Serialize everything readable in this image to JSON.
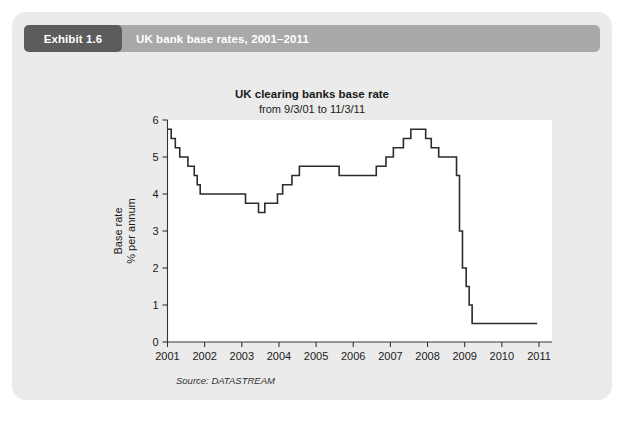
{
  "exhibit": {
    "tab_label": "Exhibit 1.6",
    "caption": "UK bank base rates, 2001–2011"
  },
  "chart_data": {
    "type": "line",
    "line_style": "step",
    "title": "UK clearing banks base rate",
    "subtitle": "from 9/3/01 to 11/3/11",
    "source": "Source: DATASTREAM",
    "xlabel": "",
    "ylabel": "Base rate\n% per annum",
    "ylabel_line1": "Base rate",
    "ylabel_line2": "% per annum",
    "xlim": [
      2001.0,
      2011.35
    ],
    "ylim": [
      0,
      6
    ],
    "yticks": [
      0,
      1,
      2,
      3,
      4,
      5,
      6
    ],
    "ytick_labels": [
      "0",
      "1",
      "2",
      "3",
      "4",
      "5",
      "6"
    ],
    "xticks": [
      2001,
      2002,
      2003,
      2004,
      2005,
      2006,
      2007,
      2008,
      2009,
      2010,
      2011
    ],
    "xtick_labels": [
      "2001",
      "2002",
      "2003",
      "2004",
      "2005",
      "2006",
      "2007",
      "2008",
      "2009",
      "2010",
      "2011"
    ],
    "grid": false,
    "legend": false,
    "series": [
      {
        "name": "UK clearing banks base rate",
        "color": "#2b2b2b",
        "x": [
          2001.0,
          2001.1,
          2001.1,
          2001.21,
          2001.21,
          2001.33,
          2001.33,
          2001.55,
          2001.55,
          2001.72,
          2001.72,
          2001.8,
          2001.8,
          2001.88,
          2001.88,
          2003.1,
          2003.1,
          2003.45,
          2003.45,
          2003.62,
          2003.62,
          2003.8,
          2003.8,
          2003.96,
          2003.96,
          2004.1,
          2004.1,
          2004.35,
          2004.35,
          2004.55,
          2004.55,
          2005.62,
          2005.62,
          2006.62,
          2006.62,
          2006.88,
          2006.88,
          2007.08,
          2007.08,
          2007.35,
          2007.35,
          2007.55,
          2007.55,
          2007.95,
          2007.95,
          2008.1,
          2008.1,
          2008.3,
          2008.3,
          2008.78,
          2008.78,
          2008.86,
          2008.86,
          2008.94,
          2008.94,
          2009.04,
          2009.04,
          2009.12,
          2009.12,
          2009.2,
          2009.2,
          2010.95
        ],
        "y": [
          5.75,
          5.75,
          5.5,
          5.5,
          5.25,
          5.25,
          5.0,
          5.0,
          4.75,
          4.75,
          4.5,
          4.5,
          4.25,
          4.25,
          4.0,
          4.0,
          3.75,
          3.75,
          3.5,
          3.5,
          3.75,
          3.75,
          3.75,
          3.75,
          4.0,
          4.0,
          4.25,
          4.25,
          4.5,
          4.5,
          4.75,
          4.75,
          4.5,
          4.5,
          4.75,
          4.75,
          5.0,
          5.0,
          5.25,
          5.25,
          5.5,
          5.5,
          5.75,
          5.75,
          5.5,
          5.5,
          5.25,
          5.25,
          5.0,
          5.0,
          4.5,
          4.5,
          3.0,
          3.0,
          2.0,
          2.0,
          1.5,
          1.5,
          1.0,
          1.0,
          0.5,
          0.5
        ],
        "key_points": [
          {
            "year": 2001,
            "rate": 5.75,
            "note": "start 9/3/01"
          },
          {
            "year": 2002,
            "rate": 4.0,
            "note": "plateau"
          },
          {
            "year": 2003,
            "rate": 3.5,
            "note": "trough"
          },
          {
            "year": 2005,
            "rate": 4.75,
            "note": "plateau"
          },
          {
            "year": 2007,
            "rate": 5.75,
            "note": "peak"
          },
          {
            "year": 2009,
            "rate": 0.5,
            "note": "floor after crash"
          },
          {
            "year": 2011,
            "rate": 0.5,
            "note": "end 11/3/11"
          }
        ]
      }
    ]
  }
}
